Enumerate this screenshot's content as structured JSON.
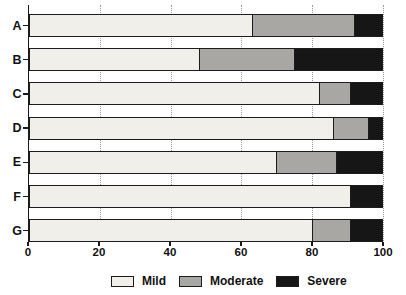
{
  "chart_data": {
    "type": "bar",
    "orientation": "horizontal",
    "stacked": true,
    "title": "",
    "xlabel": "",
    "ylabel": "",
    "categories": [
      "A",
      "B",
      "C",
      "D",
      "E",
      "F",
      "G"
    ],
    "series": [
      {
        "name": "Mild",
        "color": "#f1efe9",
        "values": [
          63,
          48,
          82,
          86,
          70,
          91,
          80
        ]
      },
      {
        "name": "Moderate",
        "color": "#a8a7a3",
        "values": [
          29,
          27,
          9,
          10,
          17,
          0,
          11
        ]
      },
      {
        "name": "Severe",
        "color": "#161616",
        "values": [
          8,
          25,
          9,
          4,
          13,
          9,
          9
        ]
      }
    ],
    "xlim": [
      0,
      100
    ],
    "xticks": [
      0,
      20,
      40,
      60,
      80,
      100
    ],
    "grid": "dotted-vertical",
    "legend_position": "bottom",
    "axis_color": "#1a1a1a"
  }
}
